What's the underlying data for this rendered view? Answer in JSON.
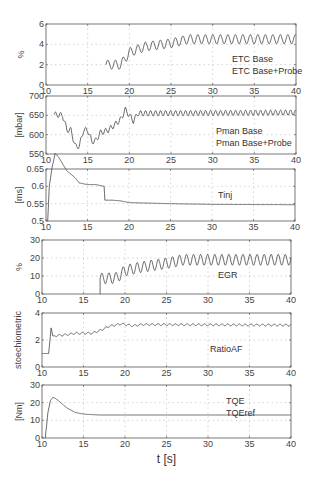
{
  "chart_data": [
    {
      "type": "line",
      "title": "",
      "ylabel": "%",
      "xlabel": "",
      "xlim": [
        10,
        40
      ],
      "ylim": [
        0,
        6
      ],
      "xticks": [
        10,
        15,
        20,
        25,
        30,
        35,
        40
      ],
      "yticks": [
        0,
        2,
        4,
        6
      ],
      "grid": true,
      "legend": [
        "ETC Base",
        "ETC Base+Probe"
      ],
      "box": {
        "x": 46,
        "y": 24,
        "w": 250,
        "h": 61
      },
      "series": [
        {
          "name": "ETC Base",
          "start": 17.2,
          "end": 40,
          "trend": [
            [
              17.2,
              2.0
            ],
            [
              19,
              2.0
            ],
            [
              20,
              3.2
            ],
            [
              22,
              3.8
            ],
            [
              25,
              4.1
            ],
            [
              27,
              4.5
            ],
            [
              40,
              4.5
            ]
          ],
          "osc_amp": 0.45,
          "osc_period": 0.9
        }
      ]
    },
    {
      "type": "line",
      "ylabel": "[mbar]",
      "xlim": [
        10,
        40
      ],
      "ylim": [
        550,
        700
      ],
      "xticks": [
        10,
        15,
        20,
        25,
        30,
        35,
        40
      ],
      "yticks": [
        550,
        600,
        650,
        700
      ],
      "grid": true,
      "legend": [
        "Pman Base",
        "Pman Base+Probe"
      ],
      "box": {
        "x": 46,
        "y": 96,
        "w": 250,
        "h": 58
      },
      "series": [
        {
          "name": "Pman Base",
          "start": 11,
          "end": 40,
          "trend": [
            [
              11,
              652
            ],
            [
              12,
              650
            ],
            [
              12.5,
              612
            ],
            [
              13,
              612
            ],
            [
              13.5,
              570
            ],
            [
              14,
              570
            ],
            [
              14.5,
              612
            ],
            [
              15,
              612
            ],
            [
              15.5,
              582
            ],
            [
              16,
              585
            ],
            [
              16.5,
              605
            ],
            [
              17.5,
              612
            ],
            [
              19,
              640
            ],
            [
              19.5,
              665
            ],
            [
              20.5,
              635
            ],
            [
              21,
              655
            ],
            [
              40,
              657
            ]
          ],
          "osc_amp": 7,
          "osc_period": 0.6
        }
      ]
    },
    {
      "type": "line",
      "ylabel": "[ms]",
      "xlim": [
        10,
        40
      ],
      "ylim": [
        0.5,
        0.65
      ],
      "xticks": [
        10,
        15,
        20,
        25,
        30,
        35,
        40
      ],
      "yticks": [
        0.5,
        0.55,
        0.6,
        0.65
      ],
      "grid": true,
      "legend": [
        "Tinj"
      ],
      "box": {
        "x": 46,
        "y": 169,
        "w": 249,
        "h": 52
      },
      "series": [
        {
          "name": "Tinj",
          "points": [
            [
              10.2,
              0.5
            ],
            [
              10.4,
              0.6
            ],
            [
              10.7,
              0.65
            ],
            [
              11.1,
              0.695
            ],
            [
              11.5,
              0.685
            ],
            [
              12,
              0.665
            ],
            [
              12.5,
              0.645
            ],
            [
              13,
              0.635
            ],
            [
              13.5,
              0.625
            ],
            [
              14,
              0.61
            ],
            [
              15,
              0.605
            ],
            [
              16,
              0.605
            ],
            [
              17,
              0.6
            ],
            [
              17.1,
              0.56
            ],
            [
              18,
              0.56
            ],
            [
              19,
              0.558
            ],
            [
              20,
              0.553
            ],
            [
              25,
              0.55
            ],
            [
              30,
              0.548
            ],
            [
              40,
              0.547
            ]
          ]
        }
      ]
    },
    {
      "type": "line",
      "ylabel": "%",
      "xlim": [
        10,
        40
      ],
      "ylim": [
        0,
        30
      ],
      "xticks": [
        10,
        15,
        20,
        25,
        30,
        35,
        40
      ],
      "yticks": [
        0,
        10,
        20,
        30
      ],
      "grid": true,
      "legend": [
        "EGR"
      ],
      "box": {
        "x": 42,
        "y": 240,
        "w": 249,
        "h": 54
      },
      "series": [
        {
          "name": "EGR",
          "start": 17,
          "end": 40,
          "trend": [
            [
              17,
              8.5
            ],
            [
              19,
              9
            ],
            [
              20,
              13
            ],
            [
              22,
              15
            ],
            [
              25,
              17
            ],
            [
              27,
              19
            ],
            [
              40,
              19
            ]
          ],
          "osc_amp": 3,
          "osc_period": 0.85
        }
      ]
    },
    {
      "type": "line",
      "ylabel": "stoechiometric",
      "xlim": [
        10,
        40
      ],
      "ylim": [
        0,
        4
      ],
      "xticks": [
        10,
        15,
        20,
        25,
        30,
        35,
        40
      ],
      "yticks": [
        0,
        2,
        4
      ],
      "grid": true,
      "legend": [
        "RatioAF"
      ],
      "box": {
        "x": 42,
        "y": 313,
        "w": 249,
        "h": 54
      },
      "series": [
        {
          "name": "RatioAF",
          "points": [
            [
              10,
              1.0
            ],
            [
              10.8,
              1.0
            ],
            [
              11.1,
              2.9
            ],
            [
              11.3,
              2.3
            ],
            [
              13,
              2.4
            ],
            [
              14,
              2.5
            ],
            [
              16,
              2.5
            ],
            [
              17,
              2.7
            ],
            [
              18,
              3.0
            ],
            [
              19.5,
              3.2
            ],
            [
              21,
              3.05
            ],
            [
              22,
              3.15
            ],
            [
              40,
              3.1
            ]
          ],
          "osc_amp": 0.07,
          "osc_period": 0.7
        }
      ]
    },
    {
      "type": "line",
      "ylabel": "[Nm]",
      "xlabel": "t [s]",
      "xlim": [
        10,
        40
      ],
      "ylim": [
        0,
        30
      ],
      "xticks": [
        10,
        15,
        20,
        25,
        30,
        35,
        40
      ],
      "yticks": [
        0,
        10,
        20,
        30
      ],
      "grid": true,
      "legend": [
        "TQE",
        "TQEref"
      ],
      "box": {
        "x": 42,
        "y": 385,
        "w": 249,
        "h": 53
      },
      "series": [
        {
          "name": "TQE",
          "points": [
            [
              10.4,
              0
            ],
            [
              10.7,
              14
            ],
            [
              11,
              21
            ],
            [
              11.3,
              23
            ],
            [
              11.6,
              22.5
            ],
            [
              12,
              21
            ],
            [
              13,
              17
            ],
            [
              14,
              14.5
            ],
            [
              15,
              13.5
            ],
            [
              17,
              13
            ],
            [
              40,
              13
            ]
          ]
        }
      ]
    }
  ],
  "figure": {
    "xlabel": "t [s]"
  }
}
